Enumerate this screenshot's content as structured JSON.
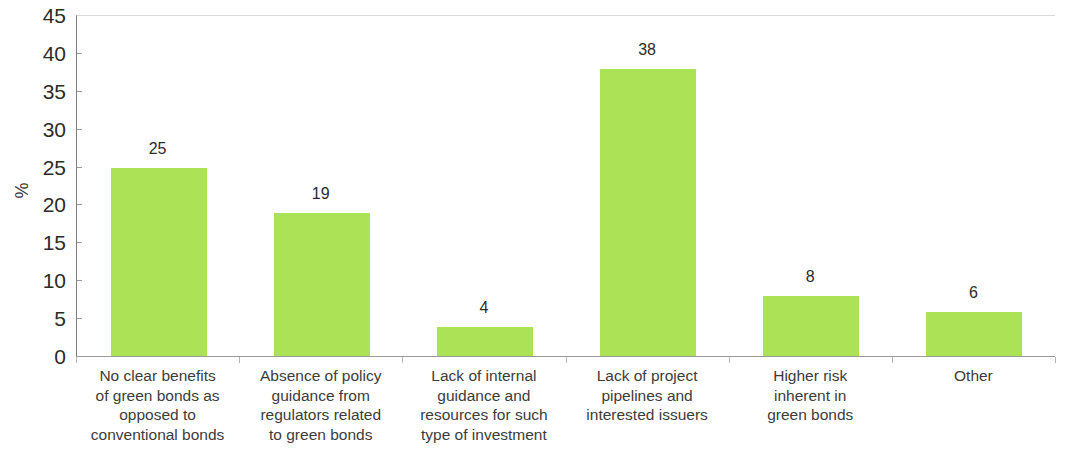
{
  "chart_data": {
    "type": "bar",
    "title": "",
    "subtitle": "",
    "xlabel": "",
    "ylabel": "%",
    "ylim": [
      0,
      45
    ],
    "ytick_step": 5,
    "yticks": [
      0,
      5,
      10,
      15,
      20,
      25,
      30,
      35,
      40,
      45
    ],
    "grid": false,
    "legend": "none",
    "bar_color": "#ace356",
    "categories": [
      "No clear benefits\nof green bonds as\nopposed to\nconventional bonds",
      "Absence of policy\nguidance from\nregulators related\nto green bonds",
      "Lack of internal\nguidance and\nresources for such\ntype of investment",
      "Lack of project\npipelines and\ninterested issuers",
      "Higher risk\ninherent in\ngreen bonds",
      "Other"
    ],
    "values": [
      25,
      19,
      4,
      38,
      8,
      6
    ],
    "value_labels": [
      "25",
      "19",
      "4",
      "38",
      "8",
      "6"
    ]
  },
  "axis": {
    "y_title": "%",
    "y_tick_labels": [
      "0",
      "5",
      "10",
      "15",
      "20",
      "25",
      "30",
      "35",
      "40",
      "45"
    ]
  }
}
